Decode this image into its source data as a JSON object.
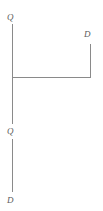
{
  "diagram": {
    "background_color": "#ffffff",
    "stroke_color": "#8a8a8a",
    "stroke_width": 1,
    "label_color": "#5b5b5b",
    "canvas": {
      "width": 103,
      "height": 211
    },
    "labels": {
      "q_top": "Q",
      "q_middle": "Q",
      "d_bottom": "D",
      "d_right": "D"
    },
    "segments": [
      {
        "name": "left-vertical-upper",
        "x1": 12,
        "y1": 24,
        "x2": 12,
        "y2": 124
      },
      {
        "name": "left-vertical-lower",
        "x1": 12,
        "y1": 139,
        "x2": 12,
        "y2": 192
      },
      {
        "name": "horizontal-connector",
        "x1": 12,
        "y1": 77,
        "x2": 91,
        "y2": 77
      },
      {
        "name": "right-vertical",
        "x1": 91,
        "y1": 44,
        "x2": 91,
        "y2": 77
      }
    ]
  }
}
